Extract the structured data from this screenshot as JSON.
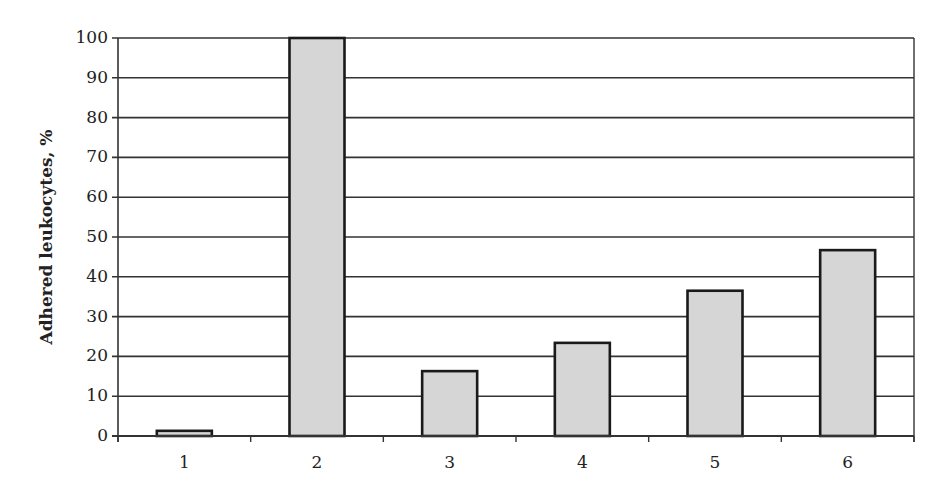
{
  "chart_data": {
    "type": "bar",
    "title": "",
    "xlabel": "",
    "ylabel": "Adhered leukocytes, %",
    "categories": [
      "1",
      "2",
      "3",
      "4",
      "5",
      "6"
    ],
    "values": [
      1.3,
      100,
      16.3,
      23.4,
      36.5,
      46.7
    ],
    "ylim": [
      0,
      100
    ],
    "yticks": [
      0,
      10,
      20,
      30,
      40,
      50,
      60,
      70,
      80,
      90,
      100
    ],
    "grid": true,
    "legend": null,
    "colors": {
      "bar_fill": "#d6d6d6",
      "bar_edge": "#1a1a1a",
      "grid": "#333333",
      "axis": "#333333"
    }
  }
}
